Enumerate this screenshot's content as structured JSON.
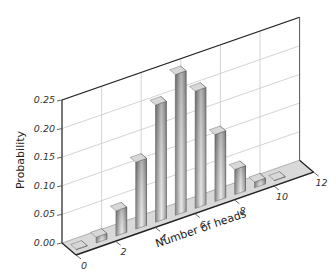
{
  "chart_data": {
    "type": "bar",
    "style": "3d",
    "title": "",
    "xlabel": "Number of heads",
    "ylabel": "Probability",
    "categories": [
      "0",
      "1",
      "2",
      "3",
      "4",
      "5",
      "6",
      "7",
      "8",
      "9",
      "10"
    ],
    "values": [
      0.001,
      0.01,
      0.044,
      0.117,
      0.205,
      0.246,
      0.205,
      0.117,
      0.044,
      0.01,
      0.001
    ],
    "x_ticks": [
      "0",
      "2",
      "4",
      "6",
      "8",
      "10",
      "12"
    ],
    "x_tick_values": [
      0,
      2,
      4,
      6,
      8,
      10,
      12
    ],
    "y_ticks": [
      "0.00",
      "0.05",
      "0.10",
      "0.15",
      "0.20",
      "0.25"
    ],
    "y_tick_values": [
      0,
      0.05,
      0.1,
      0.15,
      0.2,
      0.25
    ],
    "xlim": [
      0,
      12
    ],
    "ylim": [
      0,
      0.25
    ],
    "grid": true,
    "legend": null
  },
  "colors": {
    "bar_light": "#d8d8d8",
    "bar_mid": "#9a9a9a",
    "bar_dark": "#5a5a5a",
    "floor": "#d9d9d9",
    "grid": "#c8c8c8",
    "axis": "#222222"
  }
}
